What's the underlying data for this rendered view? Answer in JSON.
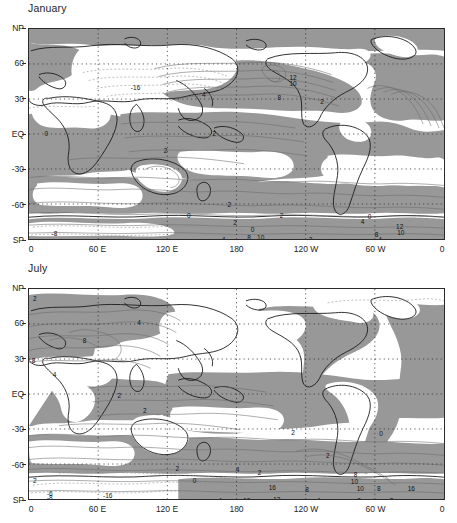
{
  "figure": {
    "background_color": "#ffffff",
    "shaded_color": "#989898",
    "land_outline_color": "#1a1a1a",
    "contour_color": "#5a5a5a",
    "grid_color": "#333333"
  },
  "panels": [
    {
      "id": "january",
      "title": "January",
      "y_axis": {
        "labels": [
          "NP",
          "60",
          "30",
          "EQ",
          "-30",
          "-60",
          "SP"
        ],
        "values": [
          90,
          60,
          30,
          0,
          -30,
          -60,
          -90
        ]
      },
      "x_axis": {
        "labels": [
          "0",
          "60 E",
          "120 E",
          "180",
          "120 W",
          "60 W",
          "0"
        ],
        "values": [
          0,
          60,
          120,
          180,
          240,
          300,
          360
        ]
      },
      "contour_labels": [
        {
          "text": "-16",
          "lon": 92,
          "lat": 41
        },
        {
          "text": "4",
          "lon": 151,
          "lat": 35
        },
        {
          "text": "12",
          "lon": 228,
          "lat": 49
        },
        {
          "text": "10",
          "lon": 228,
          "lat": 44
        },
        {
          "text": "8",
          "lon": 216,
          "lat": 32
        },
        {
          "text": "2",
          "lon": 253,
          "lat": 29
        },
        {
          "text": "2",
          "lon": 160,
          "lat": 2
        },
        {
          "text": "0",
          "lon": 15,
          "lat": 2
        },
        {
          "text": "2",
          "lon": 118,
          "lat": -13
        },
        {
          "text": "2",
          "lon": 173,
          "lat": -59
        },
        {
          "text": "2",
          "lon": 218,
          "lat": -68
        },
        {
          "text": "0",
          "lon": 138,
          "lat": -68
        },
        {
          "text": "2",
          "lon": 178,
          "lat": -74
        },
        {
          "text": "0",
          "lon": 193,
          "lat": -80
        },
        {
          "text": "-8",
          "lon": 22,
          "lat": -83
        },
        {
          "text": "4",
          "lon": 168,
          "lat": -88
        },
        {
          "text": "8",
          "lon": 190,
          "lat": -87
        },
        {
          "text": "10",
          "lon": 200,
          "lat": -87
        },
        {
          "text": "2",
          "lon": 243,
          "lat": -88
        },
        {
          "text": "0",
          "lon": 294,
          "lat": -69
        },
        {
          "text": "4",
          "lon": 288,
          "lat": -73
        },
        {
          "text": "12",
          "lon": 320,
          "lat": -77
        },
        {
          "text": "10",
          "lon": 321,
          "lat": -82
        },
        {
          "text": "8",
          "lon": 300,
          "lat": -84
        },
        {
          "text": "4",
          "lon": 303,
          "lat": -88
        }
      ]
    },
    {
      "id": "july",
      "title": "July",
      "y_axis": {
        "labels": [
          "NP",
          "60",
          "30",
          "EQ",
          "-30",
          "-60",
          "SP"
        ],
        "values": [
          90,
          60,
          30,
          0,
          -30,
          -60,
          -90
        ]
      },
      "x_axis": {
        "labels": [
          "0",
          "60 E",
          "120 E",
          "180",
          "120 W",
          "60 W",
          "0"
        ],
        "values": [
          0,
          60,
          120,
          180,
          240,
          300,
          360
        ]
      },
      "contour_labels": [
        {
          "text": "2",
          "lon": 5,
          "lat": 82
        },
        {
          "text": "4",
          "lon": 95,
          "lat": 62
        },
        {
          "text": "8",
          "lon": 48,
          "lat": 47
        },
        {
          "text": "8",
          "lon": 4,
          "lat": 30
        },
        {
          "text": "4",
          "lon": 22,
          "lat": 18
        },
        {
          "text": "2",
          "lon": 78,
          "lat": 0
        },
        {
          "text": "2",
          "lon": 100,
          "lat": -13
        },
        {
          "text": "2",
          "lon": 228,
          "lat": -31
        },
        {
          "text": "0",
          "lon": 304,
          "lat": -32
        },
        {
          "text": "2",
          "lon": 258,
          "lat": -51
        },
        {
          "text": "2",
          "lon": 128,
          "lat": -62
        },
        {
          "text": "4",
          "lon": 180,
          "lat": -63
        },
        {
          "text": "2",
          "lon": 199,
          "lat": -65
        },
        {
          "text": "2",
          "lon": 5,
          "lat": -72
        },
        {
          "text": "0",
          "lon": 143,
          "lat": -72
        },
        {
          "text": "8",
          "lon": 282,
          "lat": -67
        },
        {
          "text": "10",
          "lon": 281,
          "lat": -73
        },
        {
          "text": "16",
          "lon": 210,
          "lat": -78
        },
        {
          "text": "8",
          "lon": 240,
          "lat": -80
        },
        {
          "text": "10",
          "lon": 286,
          "lat": -79
        },
        {
          "text": "8",
          "lon": 302,
          "lat": -79
        },
        {
          "text": "16",
          "lon": 330,
          "lat": -79
        },
        {
          "text": "-6",
          "lon": 18,
          "lat": -83
        },
        {
          "text": "-8",
          "lon": 18,
          "lat": -87
        },
        {
          "text": "-16",
          "lon": 68,
          "lat": -85
        },
        {
          "text": "4",
          "lon": 165,
          "lat": -89
        },
        {
          "text": "10",
          "lon": 188,
          "lat": -89
        },
        {
          "text": "12",
          "lon": 214,
          "lat": -88
        },
        {
          "text": "4",
          "lon": 250,
          "lat": -89
        },
        {
          "text": "8",
          "lon": 285,
          "lat": -89
        },
        {
          "text": "2",
          "lon": 313,
          "lat": -89
        }
      ]
    }
  ],
  "chart_data": {
    "type": "heatmap",
    "subtitle": "",
    "xlabel": "",
    "ylabel": "",
    "projection": "cylindrical equidistant",
    "xlim": [
      0,
      360
    ],
    "ylim": [
      -90,
      90
    ],
    "xtick_labels": [
      "0",
      "60 E",
      "120 E",
      "180",
      "120 W",
      "60 W",
      "0"
    ],
    "xtick_values": [
      0,
      60,
      120,
      180,
      240,
      300,
      360
    ],
    "ytick_labels": [
      "NP",
      "60",
      "30",
      "EQ",
      "-30",
      "-60",
      "SP"
    ],
    "ytick_values": [
      90,
      60,
      30,
      0,
      -30,
      -60,
      -90
    ],
    "grid": true,
    "legend": "none",
    "shading": {
      "description": "gray fill for positive region, white for negative region",
      "gray_color": "#989898",
      "white_color": "#ffffff"
    },
    "contour_levels": [
      -16,
      -8,
      -6,
      -4,
      -2,
      0,
      2,
      4,
      6,
      8,
      10,
      12,
      16
    ],
    "series": [
      {
        "name": "January",
        "labeled_contour_values": [
          -16,
          -8,
          0,
          2,
          4,
          8,
          10,
          12
        ]
      },
      {
        "name": "July",
        "labeled_contour_values": [
          -16,
          -8,
          -6,
          0,
          2,
          4,
          8,
          10,
          12,
          16
        ]
      }
    ]
  }
}
